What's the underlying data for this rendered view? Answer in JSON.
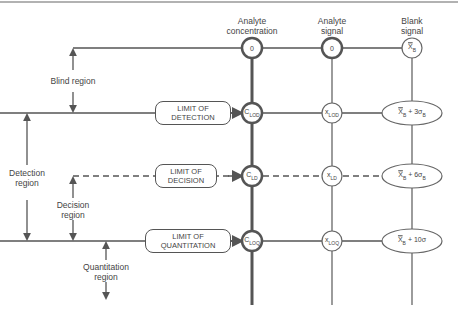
{
  "columns": {
    "analyte_concentration": "Analyte\nconcentration",
    "analyte_signal": "Analyte\nsignal",
    "blank_signal": "Blank\nsignal"
  },
  "rows": [
    {
      "name": "zero",
      "concentration": "0",
      "signal": "0",
      "blank": "x̄B"
    },
    {
      "name": "detection",
      "box_line1": "LIMIT OF",
      "box_line2": "DETECTION",
      "concentration": "CLOD",
      "signal": "xLOD",
      "blank": "x̄B + 3σB"
    },
    {
      "name": "decision",
      "box_line1": "LIMIT OF",
      "box_line2": "DECISION",
      "concentration": "CLD",
      "signal": "xLD",
      "blank": "x̄B + 6σB"
    },
    {
      "name": "quantitation",
      "box_line1": "LIMIT OF",
      "box_line2": "QUANTITATION",
      "concentration": "CLOQ",
      "signal": "xLOQ",
      "blank": "x̄B + 10σ"
    }
  ],
  "regions": {
    "blind": "Blind region",
    "detection_1": "Detection",
    "detection_2": "region",
    "decision_1": "Decision",
    "decision_2": "region",
    "quantitation_1": "Quantitation",
    "quantitation_2": "region"
  },
  "node_text": {
    "c0": "0",
    "s0": "0",
    "b0_main": "X",
    "b0_sub": "B",
    "c1_main": "C",
    "c1_sub": "LOD",
    "s1_main": "x",
    "s1_sub": "LOD",
    "b1_main": "X",
    "b1_sub": "B",
    "b1_rest": " + 3σ",
    "b1_sub2": "B",
    "c2_main": "C",
    "c2_sub": "LD",
    "s2_main": "x",
    "s2_sub": "LD",
    "b2_main": "X",
    "b2_sub": "B",
    "b2_rest": " + 6σ",
    "b2_sub2": "B",
    "c3_main": "C",
    "c3_sub": "LOQ",
    "s3_main": "x",
    "s3_sub": "LOQ",
    "b3_main": "X",
    "b3_sub": "B",
    "b3_rest": " + 10σ"
  },
  "header_labels": {
    "conc_1": "Analyte",
    "conc_2": "concentration",
    "sig_1": "Analyte",
    "sig_2": "signal",
    "blank_1": "Blank",
    "blank_2": "signal"
  }
}
